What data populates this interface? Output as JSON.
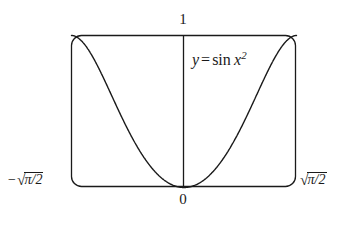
{
  "figure": {
    "kind": "function-plot",
    "background_color": "#ffffff",
    "stroke_color": "#1a1a1a",
    "frame": {
      "style": "rounded-rectangle-box",
      "corner_radius_px": 10,
      "left_px": 71,
      "top_px": 35,
      "right_px": 296,
      "bottom_px": 187
    },
    "y_axis": {
      "position_px": 183,
      "visible": true
    },
    "labels": {
      "y_max": "1",
      "origin": "0",
      "x_min_minus": "−",
      "x_min_radicand": "π/2",
      "x_max_radicand": "π/2",
      "radical_sign": "√",
      "function_y": "y",
      "function_equals": "=",
      "function_name": "sin",
      "function_var": "x",
      "function_exponent": "2"
    }
  },
  "chart_data": {
    "type": "line",
    "title": "",
    "xlabel": "",
    "ylabel": "",
    "annotations": [
      {
        "text": "y = sin x^2",
        "x": 0.35,
        "y": 0.88
      }
    ],
    "tick_labels": {
      "x": [
        "-sqrt(pi/2)",
        "0",
        "sqrt(pi/2)"
      ],
      "y": [
        "0",
        "1"
      ]
    },
    "xlim": [
      -1.2533141373155003,
      1.2533141373155003
    ],
    "ylim": [
      0,
      1
    ],
    "grid": false,
    "legend": false,
    "series": [
      {
        "name": "y = sin x^2",
        "expression": "sin(x^2)",
        "x": [
          -1.2533141373155,
          -1.19064843,
          -1.12797273,
          -1.06529703,
          -1.00262133,
          -0.93994563,
          -0.87726993,
          -0.81459423,
          -0.75191853,
          -0.68924283,
          -0.62656713,
          -0.56389143,
          -0.50121573,
          -0.43854003,
          -0.37586433,
          -0.31318863,
          -0.25051293,
          -0.18783723,
          -0.12516153,
          -0.06248583,
          0.0,
          0.06248583,
          0.12516153,
          0.18783723,
          0.25051293,
          0.31318863,
          0.37586433,
          0.43854003,
          0.50121573,
          0.56389143,
          0.62656713,
          0.68924283,
          0.75191853,
          0.81459423,
          0.87726993,
          0.93994563,
          1.00262133,
          1.06529703,
          1.12797273,
          1.19064843,
          1.2533141373155
        ],
        "y": [
          1.0,
          0.9784,
          0.9174,
          0.8244,
          0.8444,
          0.7785,
          0.6786,
          0.5988,
          0.5273,
          0.4576,
          0.3825,
          0.3115,
          0.2478,
          0.1907,
          0.1408,
          0.0979,
          0.0627,
          0.0353,
          0.0157,
          0.0039,
          0.0,
          0.0039,
          0.0157,
          0.0353,
          0.0627,
          0.0979,
          0.1408,
          0.1907,
          0.2478,
          0.3115,
          0.3825,
          0.4576,
          0.5273,
          0.5988,
          0.6786,
          0.7785,
          0.8444,
          0.8244,
          0.9174,
          0.9784,
          1.0
        ],
        "color": "#1a1a1a",
        "linewidth": 1.4
      }
    ]
  }
}
